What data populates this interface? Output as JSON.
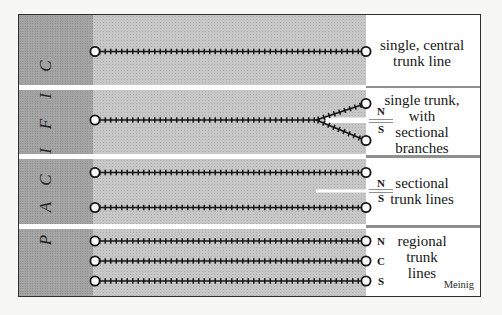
{
  "diagram": {
    "region_label": {
      "word": "PACIFIC",
      "letters_top_to_bottom": [
        "C",
        "I",
        "F",
        "I",
        "C",
        "A",
        "P"
      ]
    },
    "sections": [
      {
        "label_lines": [
          "single, central",
          "trunk line"
        ],
        "endpoint_labels": []
      },
      {
        "label_lines": [
          "single trunk,",
          "with",
          "sectional",
          "branches"
        ],
        "endpoint_labels": [
          "N",
          "S"
        ]
      },
      {
        "label_lines": [
          "sectional",
          "trunk lines"
        ],
        "endpoint_labels": [
          "N",
          "S"
        ]
      },
      {
        "label_lines": [
          "regional",
          "trunk",
          "lines"
        ],
        "endpoint_labels": [
          "N",
          "C",
          "S"
        ]
      }
    ],
    "attribution": "Meinig",
    "colors": {
      "page_background": "#f7f7f5",
      "border": "#2e2e2e",
      "ocean_band": "#a5a5a5",
      "land_area": "#c7c7c7",
      "label_column": "#ffffff",
      "rail": "#161616",
      "divider_gray": "#8f8f8f",
      "ink": "#171717"
    }
  }
}
